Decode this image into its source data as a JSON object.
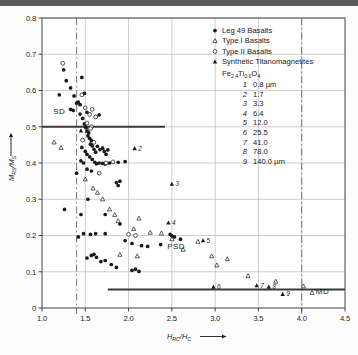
{
  "figure": {
    "background_color": "#fdfdfd",
    "frame_color": "#555555",
    "grid_color": "#b9b9b9",
    "marker_color": "#1a1a1a"
  },
  "axes": {
    "x": {
      "title": "H",
      "title_sub1": "RC",
      "title_mid": "/H",
      "title_sub2": "C",
      "arrow": "⟶",
      "min": 1.0,
      "max": 4.5,
      "ticks": [
        "1.0",
        "1.5",
        "2.0",
        "2.5",
        "3.0",
        "3.5",
        "4.0",
        "4.5"
      ],
      "tick_values": [
        1.0,
        1.5,
        2.0,
        2.5,
        3.0,
        3.5,
        4.0,
        4.5
      ]
    },
    "y": {
      "title": "M",
      "title_sub1": "RS",
      "title_mid": "/M",
      "title_sub2": "S",
      "arrow": "↑",
      "min": 0,
      "max": 0.8,
      "ticks": [
        "0",
        "0.1",
        "0.2",
        "0.3",
        "0.4",
        "0.5",
        "0.6",
        "0.7",
        "0.8"
      ],
      "tick_values": [
        0,
        0.1,
        0.2,
        0.3,
        0.4,
        0.5,
        0.6,
        0.7,
        0.8
      ]
    }
  },
  "legend": {
    "entries": [
      {
        "marker": "filled-circle",
        "label": "Leg 49 Basalts"
      },
      {
        "marker": "open-triangle",
        "label": "Type I Basalts"
      },
      {
        "marker": "open-circle",
        "label": "Type II Basalts"
      },
      {
        "marker": "filled-triangle",
        "label": "Synthetic Titanomagnetites"
      }
    ],
    "formula": {
      "pre": "Fe",
      "sub1": "2.4",
      "mid": "Ti",
      "sub2": "0.6",
      "post": "O",
      "sub3": "4"
    },
    "sizes": [
      {
        "id": "1",
        "value": "0.8 µm"
      },
      {
        "id": "2",
        "value": "1.7"
      },
      {
        "id": "3",
        "value": "3.3"
      },
      {
        "id": "4",
        "value": "6.4"
      },
      {
        "id": "5",
        "value": "12.0"
      },
      {
        "id": "6",
        "value": "25.5"
      },
      {
        "id": "7",
        "value": "41.0"
      },
      {
        "id": "8",
        "value": "78.0"
      },
      {
        "id": "9",
        "value": "140.0 µm"
      }
    ]
  },
  "region_labels": [
    {
      "text": "SD",
      "x": 1.2,
      "y": 0.535
    },
    {
      "text": "PSD",
      "x": 2.55,
      "y": 0.163
    },
    {
      "text": "MD",
      "x": 4.24,
      "y": 0.04
    }
  ],
  "reference_lines": {
    "sd_boundary": {
      "y": 0.5,
      "x_from": 1.0,
      "x_to": 2.42
    },
    "md_boundary": {
      "y": 0.051,
      "x_from": 1.76,
      "x_to": 4.5
    },
    "vertical_left": {
      "x": 1.4,
      "style": "dash-dot"
    },
    "vertical_right": {
      "x": 4.0,
      "style": "dash-dot"
    }
  },
  "chart_data": {
    "type": "scatter",
    "title": "",
    "xlabel": "HRC/HC",
    "ylabel": "MRS/MS",
    "xlim": [
      1.0,
      4.5
    ],
    "ylim": [
      0,
      0.8
    ],
    "grid": true,
    "legend_position": "top-right",
    "series": [
      {
        "name": "Leg 49 Basalts",
        "marker": "filled-circle",
        "points": [
          [
            1.2,
            0.588
          ],
          [
            1.25,
            0.657
          ],
          [
            1.28,
            0.627
          ],
          [
            1.33,
            0.607
          ],
          [
            1.37,
            0.585
          ],
          [
            1.4,
            0.565
          ],
          [
            1.42,
            0.568
          ],
          [
            1.44,
            0.561
          ],
          [
            1.33,
            0.548
          ],
          [
            1.36,
            0.545
          ],
          [
            1.46,
            0.636
          ],
          [
            1.49,
            0.592
          ],
          [
            1.52,
            0.54
          ],
          [
            1.62,
            0.528
          ],
          [
            1.66,
            0.533
          ],
          [
            1.44,
            0.535
          ],
          [
            1.47,
            0.523
          ],
          [
            1.49,
            0.508
          ],
          [
            1.5,
            0.5
          ],
          [
            1.51,
            0.497
          ],
          [
            1.52,
            0.488
          ],
          [
            1.54,
            0.483
          ],
          [
            1.46,
            0.443
          ],
          [
            1.53,
            0.475
          ],
          [
            1.55,
            0.468
          ],
          [
            1.57,
            0.462
          ],
          [
            1.56,
            0.452
          ],
          [
            1.58,
            0.447
          ],
          [
            1.6,
            0.438
          ],
          [
            1.62,
            0.43
          ],
          [
            1.5,
            0.432
          ],
          [
            1.52,
            0.424
          ],
          [
            1.55,
            0.417
          ],
          [
            1.58,
            0.41
          ],
          [
            1.64,
            0.446
          ],
          [
            1.67,
            0.437
          ],
          [
            1.7,
            0.441
          ],
          [
            1.72,
            0.432
          ],
          [
            1.74,
            0.424
          ],
          [
            1.76,
            0.436
          ],
          [
            1.45,
            0.406
          ],
          [
            1.48,
            0.4
          ],
          [
            1.61,
            0.402
          ],
          [
            1.63,
            0.398
          ],
          [
            1.66,
            0.4
          ],
          [
            1.7,
            0.399
          ],
          [
            1.73,
            0.397
          ],
          [
            1.78,
            0.4
          ],
          [
            1.88,
            0.402
          ],
          [
            1.96,
            0.404
          ],
          [
            1.4,
            0.372
          ],
          [
            1.52,
            0.383
          ],
          [
            1.57,
            0.378
          ],
          [
            1.86,
            0.346
          ],
          [
            1.88,
            0.338
          ],
          [
            1.9,
            0.35
          ],
          [
            1.53,
            0.3
          ],
          [
            1.26,
            0.272
          ],
          [
            1.73,
            0.258
          ],
          [
            1.9,
            0.232
          ],
          [
            1.73,
            0.205
          ],
          [
            1.56,
            0.203
          ],
          [
            1.62,
            0.205
          ],
          [
            1.96,
            0.186
          ],
          [
            2.04,
            0.178
          ],
          [
            2.15,
            0.172
          ],
          [
            2.22,
            0.17
          ],
          [
            2.37,
            0.175
          ],
          [
            2.48,
            0.203
          ],
          [
            2.5,
            0.199
          ],
          [
            2.53,
            0.196
          ],
          [
            2.6,
            0.19
          ],
          [
            1.52,
            0.138
          ],
          [
            1.57,
            0.145
          ],
          [
            1.6,
            0.148
          ],
          [
            1.63,
            0.14
          ],
          [
            1.68,
            0.128
          ],
          [
            1.73,
            0.131
          ],
          [
            1.8,
            0.12
          ],
          [
            1.86,
            0.112
          ],
          [
            2.04,
            0.104
          ],
          [
            2.08,
            0.107
          ],
          [
            2.12,
            0.101
          ],
          [
            1.45,
            0.258
          ],
          [
            1.42,
            0.196
          ],
          [
            1.48,
            0.205
          ]
        ]
      },
      {
        "name": "Type I Basalts",
        "marker": "open-triangle",
        "points": [
          [
            1.14,
            0.457
          ],
          [
            1.22,
            0.442
          ],
          [
            1.5,
            0.355
          ],
          [
            1.59,
            0.33
          ],
          [
            1.64,
            0.318
          ],
          [
            1.7,
            0.3
          ],
          [
            1.78,
            0.272
          ],
          [
            1.84,
            0.257
          ],
          [
            1.88,
            0.24
          ],
          [
            2.12,
            0.247
          ],
          [
            2.06,
            0.218
          ],
          [
            2.25,
            0.208
          ],
          [
            2.38,
            0.206
          ],
          [
            2.5,
            0.19
          ],
          [
            1.9,
            0.147
          ],
          [
            2.1,
            0.143
          ],
          [
            2.63,
            0.161
          ],
          [
            2.96,
            0.143
          ],
          [
            3.14,
            0.135
          ],
          [
            3.38,
            0.088
          ],
          [
            3.7,
            0.073
          ],
          [
            4.02,
            0.06
          ],
          [
            4.12,
            0.042
          ],
          [
            2.8,
            0.183
          ],
          [
            3.02,
            0.118
          ]
        ]
      },
      {
        "name": "Type II Basalts",
        "marker": "open-circle",
        "points": [
          [
            1.24,
            0.675
          ],
          [
            1.46,
            0.588
          ],
          [
            1.5,
            0.552
          ],
          [
            1.58,
            0.548
          ],
          [
            1.55,
            0.534
          ],
          [
            1.62,
            0.527
          ],
          [
            1.52,
            0.51
          ],
          [
            1.57,
            0.5
          ],
          [
            1.56,
            0.495
          ],
          [
            1.47,
            0.463
          ],
          [
            1.6,
            0.457
          ],
          [
            1.74,
            0.4
          ],
          [
            1.82,
            0.403
          ],
          [
            1.66,
            0.372
          ],
          [
            2.0,
            0.203
          ],
          [
            2.08,
            0.2
          ]
        ]
      },
      {
        "name": "Synthetic Titanomagnetites",
        "marker": "filled-triangle",
        "labeled_points": [
          {
            "id": "1",
            "x": 1.45,
            "y": 0.489
          },
          {
            "id": "2",
            "x": 2.07,
            "y": 0.44
          },
          {
            "id": "3",
            "x": 2.5,
            "y": 0.342
          },
          {
            "id": "4",
            "x": 2.46,
            "y": 0.235
          },
          {
            "id": "5",
            "x": 2.86,
            "y": 0.186
          },
          {
            "id": "6",
            "x": 2.98,
            "y": 0.058
          },
          {
            "id": "7",
            "x": 3.48,
            "y": 0.062
          },
          {
            "id": "8",
            "x": 3.62,
            "y": 0.058
          },
          {
            "id": "9",
            "x": 3.78,
            "y": 0.038
          }
        ]
      }
    ]
  }
}
